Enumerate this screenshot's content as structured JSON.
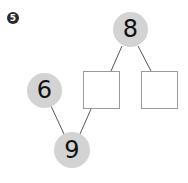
{
  "problem_number": "5",
  "diagram": {
    "type": "number-bond",
    "nodes": [
      {
        "id": "top",
        "value": "8",
        "shape": "circle"
      },
      {
        "id": "blank-left",
        "value": "",
        "shape": "square"
      },
      {
        "id": "blank-right",
        "value": "",
        "shape": "square"
      },
      {
        "id": "left",
        "value": "6",
        "shape": "circle"
      },
      {
        "id": "bottom",
        "value": "9",
        "shape": "circle"
      }
    ],
    "edges": [
      [
        "top",
        "blank-left"
      ],
      [
        "top",
        "blank-right"
      ],
      [
        "left",
        "bottom"
      ],
      [
        "blank-left",
        "bottom"
      ]
    ]
  },
  "colors": {
    "circle_fill": "#d3d3d3",
    "line": "#555555",
    "box_border": "#9a9a9a"
  }
}
